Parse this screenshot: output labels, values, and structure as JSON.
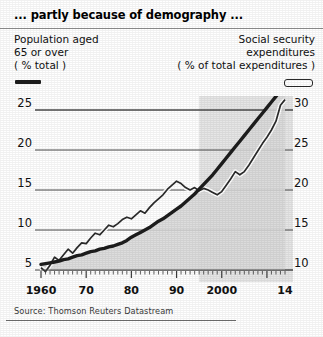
{
  "title": "... partly because of demography ...",
  "legend": {
    "left": {
      "lines": [
        "Population aged",
        "65 or over",
        "( % total )"
      ],
      "swatch": "solid-thick-line-swatch"
    },
    "right": {
      "lines": [
        "Social security",
        "expenditures",
        "( % of total expenditures )"
      ],
      "swatch": "hollow-outline-line-swatch"
    }
  },
  "source": "Source: Thomson Reuters Datastream",
  "colors": {
    "line_population": "#1d1d1d",
    "line_socsec": "#2b2b2b",
    "area_fill": "#d9d9d9",
    "grid": "#4a4a4a",
    "panel_shade": "#e2e2e2",
    "text": "#111111"
  },
  "chart_data": {
    "type": "line",
    "title": "... partly because of demography ...",
    "xlabel": "",
    "ylabel": "Population aged 65 or over (% total)",
    "ylabel_right": "Social security expenditures (% of total expenditures)",
    "grid": true,
    "legend_position": "top",
    "x": [
      1960,
      1961,
      1962,
      1963,
      1964,
      1965,
      1966,
      1967,
      1968,
      1969,
      1970,
      1971,
      1972,
      1973,
      1974,
      1975,
      1976,
      1977,
      1978,
      1979,
      1980,
      1981,
      1982,
      1983,
      1984,
      1985,
      1986,
      1987,
      1988,
      1989,
      1990,
      1991,
      1992,
      1993,
      1994,
      1995,
      1996,
      1997,
      1998,
      1999,
      2000,
      2001,
      2002,
      2003,
      2004,
      2005,
      2006,
      2007,
      2008,
      2009,
      2010,
      2011,
      2012,
      2013,
      2014
    ],
    "xlim": [
      1960,
      2014
    ],
    "x_ticks": [
      1960,
      1970,
      1980,
      1990,
      2000,
      2014
    ],
    "x_tick_labels": [
      "1960",
      "70",
      "80",
      "90",
      "2000",
      "14"
    ],
    "x_minor_tick_interval": 1,
    "left_axis": {
      "ticks": [
        5,
        10,
        15,
        20,
        25
      ],
      "tick_labels": [
        "5",
        "10",
        "15",
        "20",
        "25"
      ],
      "ylim": [
        4.0,
        27.0
      ],
      "unit": "% total"
    },
    "right_axis": {
      "ticks": [
        10,
        15,
        20,
        25,
        30
      ],
      "tick_labels": [
        "10",
        "15",
        "20",
        "25",
        "30"
      ],
      "ylim": [
        9.0,
        32.0
      ],
      "unit": "% of total expenditures"
    },
    "series": [
      {
        "name": "Population aged 65 or over (% total)",
        "axis": "left",
        "style": "thick-smooth",
        "filled_area": true,
        "values": [
          5.7,
          5.8,
          5.9,
          6.0,
          6.1,
          6.3,
          6.4,
          6.6,
          6.8,
          6.9,
          7.1,
          7.3,
          7.4,
          7.6,
          7.7,
          7.9,
          8.0,
          8.2,
          8.4,
          8.7,
          9.1,
          9.4,
          9.7,
          10.0,
          10.3,
          10.7,
          11.1,
          11.4,
          11.8,
          12.2,
          12.6,
          13.0,
          13.5,
          14.0,
          14.5,
          15.1,
          15.7,
          16.3,
          16.9,
          17.6,
          18.3,
          19.0,
          19.7,
          20.4,
          21.1,
          21.8,
          22.5,
          23.2,
          23.9,
          24.6,
          25.3,
          26.0,
          26.7,
          27.4,
          28.2
        ]
      },
      {
        "name": "Social security expenditures (% of total expenditures)",
        "axis": "right",
        "style": "thin-jagged",
        "filled_area": false,
        "values": [
          10.3,
          9.8,
          10.6,
          11.6,
          11.2,
          11.9,
          12.6,
          12.1,
          12.8,
          13.4,
          13.3,
          14.0,
          14.6,
          14.4,
          15.0,
          15.6,
          15.4,
          15.8,
          16.3,
          16.6,
          16.4,
          16.9,
          17.4,
          17.1,
          17.8,
          18.4,
          18.9,
          19.4,
          20.1,
          20.6,
          21.1,
          20.8,
          20.3,
          20.0,
          20.3,
          19.9,
          20.2,
          20.0,
          19.7,
          19.4,
          19.8,
          20.6,
          21.4,
          22.3,
          21.9,
          22.3,
          23.1,
          24.0,
          24.9,
          25.8,
          26.6,
          27.5,
          28.6,
          30.6,
          31.3
        ]
      }
    ]
  }
}
